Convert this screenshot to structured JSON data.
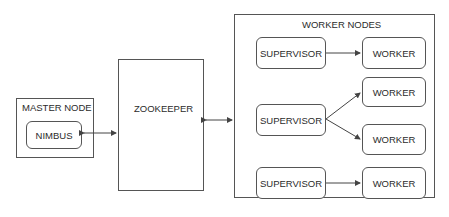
{
  "master": {
    "title": "MASTER NODE",
    "nimbus": "NIMBUS"
  },
  "zookeeper": {
    "label": "ZOOKEEPER"
  },
  "workers": {
    "title": "WORKER NODES",
    "supervisors": [
      "SUPERVISOR",
      "SUPERVISOR",
      "SUPERVISOR"
    ],
    "workers": [
      "WORKER",
      "WORKER",
      "WORKER",
      "WORKER"
    ]
  },
  "colors": {
    "line": "#555555",
    "text": "#2b2b2b"
  }
}
